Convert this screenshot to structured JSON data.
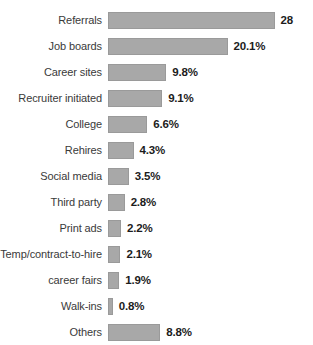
{
  "chart_data": {
    "type": "bar",
    "orientation": "horizontal",
    "title": "",
    "subtitle": "",
    "xlabel": "",
    "ylabel": "",
    "grid": false,
    "legend": null,
    "xlim": [
      0,
      28
    ],
    "categories": [
      "Referrals",
      "Job boards",
      "Career sites",
      "Recruiter initiated",
      "College",
      "Rehires",
      "Social media",
      "Third party",
      "Print ads",
      "Temp/contract-to-hire",
      "career fairs",
      "Walk-ins",
      "Others"
    ],
    "values": [
      28,
      20.1,
      9.8,
      9.1,
      6.6,
      4.3,
      3.5,
      2.8,
      2.2,
      2.1,
      1.9,
      0.8,
      8.8
    ],
    "value_labels": [
      "28",
      "20.1%",
      "9.8%",
      "9.1%",
      "6.6%",
      "4.3%",
      "3.5%",
      "2.8%",
      "2.2%",
      "2.1%",
      "1.9%",
      "0.8%",
      "8.8%"
    ],
    "bar_color": "#a8a8a8",
    "bar_border_color": "#9a9a9a",
    "label_color": "#3a3a3a",
    "value_color": "#1c1c1c",
    "background": "#ffffff",
    "px_per_unit": 5.95
  }
}
